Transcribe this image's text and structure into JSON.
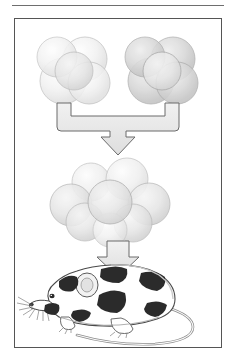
{
  "figure": {
    "caption": "",
    "frame": {
      "border_color": "#555555",
      "background": "#ffffff",
      "x": 14,
      "y": 18,
      "width": 208,
      "height": 330
    },
    "top_rule": {
      "color": "#6e6e6e",
      "x": 12,
      "y": 5,
      "width": 212
    }
  },
  "palette": {
    "cell_light_fill": "#f2f2f2",
    "cell_light_edge": "#b9b9b9",
    "cell_dark_fill": "#d8d8d8",
    "cell_dark_edge": "#9a9a9a",
    "cell_mid_fill": "#e8e8e8",
    "arrow_fill": "#e6e6e6",
    "arrow_edge": "#6a6a6a",
    "mouse_patch": "#2b2b2b",
    "mouse_body": "#ffffff",
    "mouse_outline": "#4a4a4a",
    "mouse_shade": "#c9c9c9"
  },
  "steps": [
    {
      "id": "embryo-left",
      "label": "Morula A (light strain)",
      "cell_count": 5,
      "shade": "light"
    },
    {
      "id": "embryo-right",
      "label": "Morula B (dark strain)",
      "cell_count": 5,
      "shade": "dark"
    },
    {
      "id": "merge-bracket",
      "label": "Aggregate the two morulae",
      "shape": "bracket-down-arrow"
    },
    {
      "id": "embryo-aggregate",
      "label": "Aggregated chimeric blastomere cluster",
      "cell_count": 7,
      "shade": "mixed"
    },
    {
      "id": "transfer-arrow",
      "label": "Transfer to foster mother and develop",
      "shape": "down-arrow"
    },
    {
      "id": "chimeric-mouse",
      "label": "Chimeric mouse with black and white coat patches",
      "coat": "patched"
    }
  ]
}
